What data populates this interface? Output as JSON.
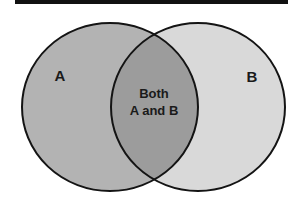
{
  "diagram": {
    "type": "venn",
    "sets": [
      {
        "id": "A",
        "label": "A",
        "fill": "#b3b3b3"
      },
      {
        "id": "B",
        "label": "B",
        "fill": "#d9d9d9"
      }
    ],
    "intersection": {
      "line1": "Both",
      "line2": "A and B",
      "fill": "#9c9c9c"
    },
    "stroke": "#141414",
    "top_rule_color": "#111111"
  }
}
